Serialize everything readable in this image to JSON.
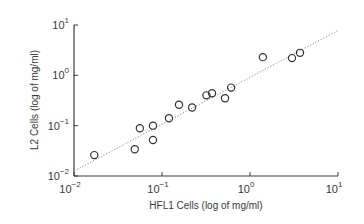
{
  "chart_data": {
    "type": "scatter",
    "title": "",
    "xlabel": "HFL1 Cells (log of mg/ml)",
    "ylabel": "L2 Cells (log of mg/ml)",
    "xscale": "log",
    "yscale": "log",
    "xlim": [
      0.01,
      10
    ],
    "ylim": [
      0.01,
      10
    ],
    "x_ticks": [
      {
        "base": "10",
        "exp": "−2",
        "value": 0.01
      },
      {
        "base": "10",
        "exp": "−1",
        "value": 0.1
      },
      {
        "base": "10",
        "exp": "0",
        "value": 1
      },
      {
        "base": "10",
        "exp": "1",
        "value": 10
      }
    ],
    "y_ticks": [
      {
        "base": "10",
        "exp": "−2",
        "value": 0.01
      },
      {
        "base": "10",
        "exp": "−1",
        "value": 0.1
      },
      {
        "base": "10",
        "exp": "0",
        "value": 1
      },
      {
        "base": "10",
        "exp": "1",
        "value": 10
      }
    ],
    "grid": false,
    "legend": null,
    "series": [
      {
        "name": "data",
        "marker": "open-circle",
        "points": [
          {
            "x": 0.017,
            "y": 0.026
          },
          {
            "x": 0.049,
            "y": 0.034
          },
          {
            "x": 0.056,
            "y": 0.089
          },
          {
            "x": 0.079,
            "y": 0.052
          },
          {
            "x": 0.079,
            "y": 0.1
          },
          {
            "x": 0.12,
            "y": 0.14
          },
          {
            "x": 0.156,
            "y": 0.26
          },
          {
            "x": 0.22,
            "y": 0.23
          },
          {
            "x": 0.32,
            "y": 0.4
          },
          {
            "x": 0.37,
            "y": 0.44
          },
          {
            "x": 0.52,
            "y": 0.35
          },
          {
            "x": 0.61,
            "y": 0.57
          },
          {
            "x": 1.4,
            "y": 2.3
          },
          {
            "x": 3.0,
            "y": 2.2
          },
          {
            "x": 3.7,
            "y": 2.8
          }
        ]
      },
      {
        "name": "fit",
        "style": "dotted-line",
        "points": [
          {
            "x": 0.0101,
            "y": 0.0126
          },
          {
            "x": 10,
            "y": 7.8
          }
        ]
      }
    ],
    "colors": {
      "axis": "#3a3a3a",
      "marker": "#333333",
      "fit_line": "#8a8a8a"
    }
  }
}
